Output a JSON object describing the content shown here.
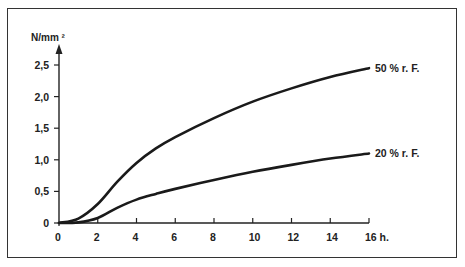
{
  "chart_data": {
    "type": "line",
    "title": "",
    "ylabel": "N/mm ²",
    "xlabel": "h.",
    "xlim": [
      0,
      16
    ],
    "ylim": [
      0,
      2.5
    ],
    "grid": false,
    "legend_position": "inline-right",
    "x_ticks": [
      0,
      2,
      4,
      6,
      8,
      10,
      12,
      14,
      16
    ],
    "x_tick_labels": [
      "0",
      "2",
      "4",
      "6",
      "8",
      "10",
      "12",
      "14",
      "16 h."
    ],
    "y_ticks": [
      0,
      0.5,
      1.0,
      1.5,
      2.0,
      2.5
    ],
    "y_tick_labels": [
      "0",
      "0,5",
      "1,0",
      "1,5",
      "2,0",
      "2,5"
    ],
    "x": [
      0,
      1,
      2,
      3,
      4,
      5,
      6,
      8,
      10,
      12,
      14,
      16
    ],
    "series": [
      {
        "name": "50 % r. F.",
        "values": [
          0,
          0.07,
          0.3,
          0.65,
          0.95,
          1.18,
          1.36,
          1.66,
          1.92,
          2.13,
          2.31,
          2.45
        ]
      },
      {
        "name": "20 % r. F.",
        "values": [
          0,
          0.01,
          0.08,
          0.24,
          0.37,
          0.46,
          0.54,
          0.68,
          0.81,
          0.92,
          1.02,
          1.1
        ]
      }
    ]
  },
  "colors": {
    "line": "#1a1a1a",
    "axis": "#222222",
    "frame": "#333333",
    "background": "#ffffff"
  }
}
